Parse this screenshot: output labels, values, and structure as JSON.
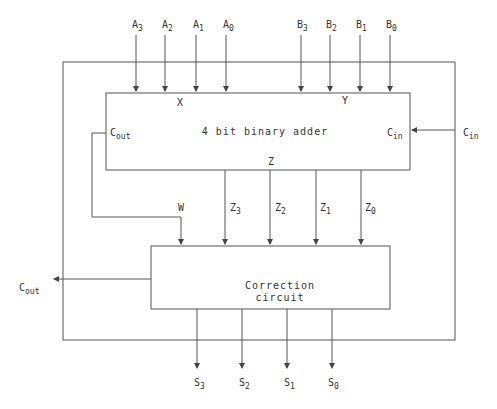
{
  "inputs_a": [
    {
      "base": "A",
      "sub": "3"
    },
    {
      "base": "A",
      "sub": "2"
    },
    {
      "base": "A",
      "sub": "1"
    },
    {
      "base": "A",
      "sub": "0"
    }
  ],
  "inputs_b": [
    {
      "base": "B",
      "sub": "3"
    },
    {
      "base": "B",
      "sub": "2"
    },
    {
      "base": "B",
      "sub": "1"
    },
    {
      "base": "B",
      "sub": "0"
    }
  ],
  "adder": {
    "title": "4 bit binary adder",
    "port_x": "X",
    "port_y": "Y",
    "port_z": "Z",
    "cout": {
      "base": "C",
      "sub": "out"
    },
    "cin": {
      "base": "C",
      "sub": "in"
    }
  },
  "cin_external": {
    "base": "C",
    "sub": "in"
  },
  "w_label": "W",
  "z_lines": [
    {
      "base": "Z",
      "sub": "3"
    },
    {
      "base": "Z",
      "sub": "2"
    },
    {
      "base": "Z",
      "sub": "1"
    },
    {
      "base": "Z",
      "sub": "0"
    }
  ],
  "correction": {
    "line1": "Correction",
    "line2": "circuit"
  },
  "cout_external": {
    "base": "C",
    "sub": "out"
  },
  "outputs": [
    {
      "base": "S",
      "sub": "3"
    },
    {
      "base": "S",
      "sub": "2"
    },
    {
      "base": "S",
      "sub": "1"
    },
    {
      "base": "S",
      "sub": "0"
    }
  ]
}
